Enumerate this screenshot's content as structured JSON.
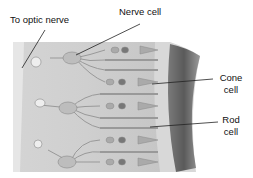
{
  "diagram": {
    "labels": {
      "optic_nerve": "To optic nerve",
      "nerve_cell": "Nerve cell",
      "cone_cell_line1": "Cone",
      "cone_cell_line2": "cell",
      "rod_cell_line1": "Rod",
      "rod_cell_line2": "cell"
    }
  }
}
